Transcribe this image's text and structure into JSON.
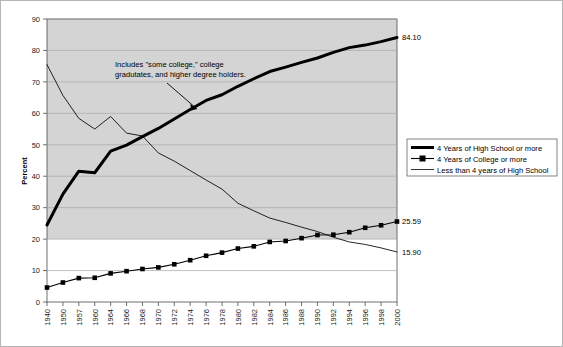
{
  "chart_data": {
    "type": "line",
    "title": "",
    "xlabel": "",
    "ylabel": "Percent",
    "ylim": [
      0,
      90
    ],
    "ytick_step": 10,
    "yticks": [
      0,
      10,
      20,
      30,
      40,
      50,
      60,
      70,
      80,
      90
    ],
    "grid": true,
    "legend_position": "right",
    "categories": [
      "1940",
      "1950",
      "1957",
      "1960",
      "1964",
      "1966",
      "1968",
      "1970",
      "1972",
      "1974",
      "1976",
      "1978",
      "1980",
      "1982",
      "1984",
      "1986",
      "1988",
      "1990",
      "1992",
      "1994",
      "1996",
      "1998",
      "2000"
    ],
    "series": [
      {
        "name": "4 Years of High School or more",
        "style": "thick-line",
        "values": [
          24.5,
          34.3,
          41.6,
          41.1,
          48.0,
          49.9,
          52.6,
          55.2,
          58.2,
          61.2,
          64.1,
          65.9,
          68.6,
          71.0,
          73.3,
          74.7,
          76.2,
          77.6,
          79.4,
          80.9,
          81.7,
          82.8,
          84.1
        ]
      },
      {
        "name": "4 Years of College or more",
        "style": "marker-line",
        "values": [
          4.6,
          6.2,
          7.6,
          7.7,
          9.1,
          9.8,
          10.5,
          11.0,
          12.0,
          13.3,
          14.7,
          15.7,
          17.0,
          17.7,
          19.1,
          19.4,
          20.3,
          21.3,
          21.4,
          22.2,
          23.6,
          24.4,
          25.59
        ]
      },
      {
        "name": "Less than 4 years of High School",
        "style": "thin-line",
        "values": [
          75.5,
          65.7,
          58.4,
          55.0,
          59.0,
          53.7,
          52.8,
          47.4,
          44.8,
          41.8,
          38.8,
          35.9,
          31.4,
          29.0,
          26.7,
          25.3,
          23.8,
          22.4,
          20.6,
          19.1,
          18.3,
          17.2,
          15.9
        ]
      }
    ],
    "end_labels": [
      {
        "series": "4 Years of High School or more",
        "value": "84.10"
      },
      {
        "series": "4 Years of College or more",
        "value": "25.59"
      },
      {
        "series": "Less than 4 years of High School",
        "value": "15.90"
      }
    ],
    "annotations": [
      {
        "id": "college-note",
        "line1": "Includes \"some college,\" college",
        "line2": "gradutates, and higher degree holders.",
        "arrow_target_series": "4 Years of High School or more"
      }
    ],
    "legend": [
      {
        "label": "4 Years of High School or more",
        "marker": "thick-line"
      },
      {
        "label": "4 Years of College or more",
        "marker": "marker-line"
      },
      {
        "label": "Less than 4 years of High School",
        "marker": "thin-line"
      }
    ],
    "colors": {
      "line": "#000000",
      "plot_band": "#d4d4d4",
      "plot_background": "#ffffff",
      "grid": "#a8a8a8",
      "axis": "#4d4d4d",
      "figure_border": "#b5b5b5"
    }
  }
}
